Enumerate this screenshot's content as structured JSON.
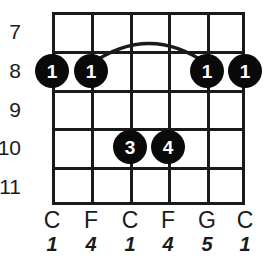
{
  "diagram": {
    "type": "guitar-chord-diagram",
    "strings_count": 6,
    "frets_count": 5,
    "colors": {
      "grid": "#1a1a1a",
      "dot_fill": "#0a0a0a",
      "dot_text": "#ffffff",
      "background": "#ffffff"
    },
    "fret_numbers": [
      {
        "label": "7"
      },
      {
        "label": "8"
      },
      {
        "label": "9"
      },
      {
        "label": "10"
      },
      {
        "label": "11"
      }
    ],
    "finger_dots": [
      {
        "finger": "1",
        "string": 1,
        "fret": 8
      },
      {
        "finger": "1",
        "string": 2,
        "fret": 8
      },
      {
        "finger": "3",
        "string": 3,
        "fret": 10
      },
      {
        "finger": "4",
        "string": 4,
        "fret": 10
      },
      {
        "finger": "1",
        "string": 5,
        "fret": 8
      },
      {
        "finger": "1",
        "string": 6,
        "fret": 8
      }
    ],
    "barre": {
      "present": true,
      "fret": 8,
      "from_string": 2,
      "to_string": 5,
      "finger": "1"
    },
    "note_labels": [
      {
        "note": "C"
      },
      {
        "note": "F"
      },
      {
        "note": "C"
      },
      {
        "note": "F"
      },
      {
        "note": "G"
      },
      {
        "note": "C"
      }
    ],
    "interval_labels": [
      {
        "interval": "1"
      },
      {
        "interval": "4"
      },
      {
        "interval": "1"
      },
      {
        "interval": "4"
      },
      {
        "interval": "5"
      },
      {
        "interval": "1"
      }
    ]
  }
}
